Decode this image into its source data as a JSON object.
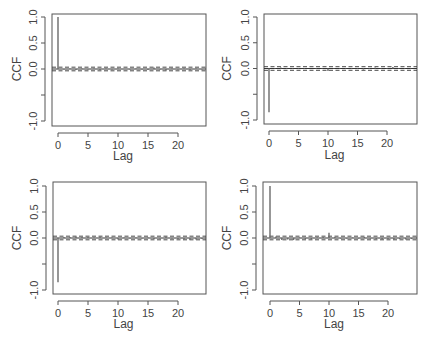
{
  "chart_data": [
    {
      "type": "bar",
      "subtype": "ccf-stem",
      "panel": "top-left",
      "xlabel": "Lag",
      "ylabel": "CCF",
      "xticks": [
        0,
        5,
        10,
        15,
        20
      ],
      "yticks": [
        -1.0,
        -0.5,
        0.0,
        0.5,
        1.0
      ],
      "ytick_labels": [
        "-1.0",
        "",
        "0.0",
        "0.5",
        "1.0"
      ],
      "xlim": [
        -0.5,
        25
      ],
      "ylim": [
        -1.05,
        1.05
      ],
      "confidence_band": 0.035,
      "lags": [
        0,
        1,
        2,
        3,
        4,
        5,
        6,
        7,
        8,
        9,
        10,
        11,
        12,
        13,
        14,
        15,
        16,
        17,
        18,
        19,
        20,
        21,
        22,
        23,
        24
      ],
      "values": [
        1.0,
        -0.01,
        0.01,
        -0.02,
        0.01,
        -0.01,
        0.01,
        -0.02,
        0.01,
        -0.01,
        0.01,
        0.0,
        -0.01,
        0.01,
        -0.01,
        -0.02,
        0.03,
        -0.01,
        -0.03,
        0.01,
        -0.01,
        0.01,
        -0.02,
        0.01,
        -0.01
      ]
    },
    {
      "type": "bar",
      "subtype": "ccf-stem",
      "panel": "top-right",
      "xlabel": "Lag",
      "ylabel": "CCF",
      "xticks": [
        0,
        5,
        10,
        15,
        20
      ],
      "yticks": [
        -1.0,
        -0.5,
        0.0,
        0.5,
        1.0
      ],
      "ytick_labels": [
        "-1.0",
        "",
        "0.0",
        "0.5",
        "1.0"
      ],
      "xlim": [
        -0.5,
        25
      ],
      "ylim": [
        -1.05,
        1.05
      ],
      "confidence_band": 0.035,
      "lags": [
        0,
        1,
        2,
        3,
        4,
        5,
        6,
        7,
        8,
        9,
        10,
        11,
        12,
        13,
        14,
        15,
        16,
        17,
        18,
        19,
        20,
        21,
        22,
        23,
        24
      ],
      "values": [
        -0.85,
        0.01,
        0.02,
        -0.01,
        0.01,
        -0.01,
        0.01,
        0.0,
        -0.01,
        0.01,
        -0.05,
        0.01,
        -0.01,
        0.01,
        -0.01,
        0.01,
        -0.02,
        0.01,
        0.02,
        -0.01,
        0.01,
        0.03,
        -0.01,
        0.01,
        -0.01
      ]
    },
    {
      "type": "bar",
      "subtype": "ccf-stem",
      "panel": "bottom-left",
      "xlabel": "Lag",
      "ylabel": "CCF",
      "xticks": [
        0,
        5,
        10,
        15,
        20
      ],
      "yticks": [
        -1.0,
        -0.5,
        0.0,
        0.5,
        1.0
      ],
      "ytick_labels": [
        "-1.0",
        "",
        "0.0",
        "0.5",
        "1.0"
      ],
      "xlim": [
        -0.5,
        25
      ],
      "ylim": [
        -1.05,
        1.05
      ],
      "confidence_band": 0.035,
      "lags": [
        0,
        1,
        2,
        3,
        4,
        5,
        6,
        7,
        8,
        9,
        10,
        11,
        12,
        13,
        14,
        15,
        16,
        17,
        18,
        19,
        20,
        21,
        22,
        23,
        24
      ],
      "values": [
        -0.85,
        0.02,
        0.02,
        0.03,
        0.02,
        0.02,
        0.01,
        0.03,
        0.01,
        0.01,
        -0.03,
        0.01,
        -0.01,
        0.01,
        -0.01,
        0.01,
        -0.02,
        -0.01,
        0.03,
        -0.01,
        -0.02,
        -0.03,
        -0.04,
        -0.03,
        -0.02
      ]
    },
    {
      "type": "bar",
      "subtype": "ccf-stem",
      "panel": "bottom-right",
      "xlabel": "Lag",
      "ylabel": "CCF",
      "xticks": [
        0,
        5,
        10,
        15,
        20
      ],
      "yticks": [
        -1.0,
        -0.5,
        0.0,
        0.5,
        1.0
      ],
      "ytick_labels": [
        "-1.0",
        "",
        "0.0",
        "0.5",
        "1.0"
      ],
      "xlim": [
        -0.5,
        25
      ],
      "ylim": [
        -1.05,
        1.05
      ],
      "confidence_band": 0.035,
      "lags": [
        0,
        1,
        2,
        3,
        4,
        5,
        6,
        7,
        8,
        9,
        10,
        11,
        12,
        13,
        14,
        15,
        16,
        17,
        18,
        19,
        20,
        21,
        22,
        23,
        24
      ],
      "values": [
        1.0,
        0.03,
        -0.04,
        -0.03,
        -0.04,
        0.01,
        -0.02,
        -0.03,
        0.01,
        0.02,
        0.1,
        0.02,
        -0.01,
        -0.01,
        0.01,
        -0.01,
        0.02,
        -0.01,
        -0.02,
        -0.03,
        -0.02,
        -0.03,
        -0.02,
        -0.03,
        -0.02
      ]
    }
  ],
  "panels": [
    {
      "ylabel": "CCF",
      "xlabel": "Lag",
      "xtick_labels": [
        "0",
        "5",
        "10",
        "15",
        "20"
      ],
      "ytick_labels": [
        "-1.0",
        "0.0",
        "0.5",
        "1.0"
      ]
    },
    {
      "ylabel": "CCF",
      "xlabel": "Lag",
      "xtick_labels": [
        "0",
        "5",
        "10",
        "15",
        "20"
      ],
      "ytick_labels": [
        "-1.0",
        "0.0",
        "0.5",
        "1.0"
      ]
    },
    {
      "ylabel": "CCF",
      "xlabel": "Lag",
      "xtick_labels": [
        "0",
        "5",
        "10",
        "15",
        "20"
      ],
      "ytick_labels": [
        "-1.0",
        "0.0",
        "0.5",
        "1.0"
      ]
    },
    {
      "ylabel": "CCF",
      "xlabel": "Lag",
      "xtick_labels": [
        "0",
        "5",
        "10",
        "15",
        "20"
      ],
      "ytick_labels": [
        "-1.0",
        "0.0",
        "0.5",
        "1.0"
      ]
    }
  ],
  "colors": {
    "frame": "#555555",
    "stem": "#6a6a6a",
    "zero_line": "#333333",
    "band": "#333333",
    "text": "#444444"
  }
}
